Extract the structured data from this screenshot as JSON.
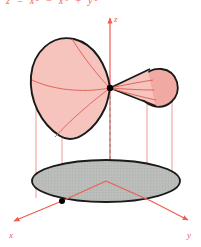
{
  "figure": {
    "kind": "3d-surface-plot",
    "caption_top": "z = x² − x³ + y²",
    "width": 201,
    "height": 247
  },
  "colors": {
    "axis_red": "#ef5d52",
    "surface_fill": "#f6c3bd",
    "surface_fill_lobe": "#f0aaa3",
    "surface_outline": "#1a1a1a",
    "contour_red": "#e0675c",
    "shadow_fill": "#b9bcb9",
    "shadow_outline": "#1a1a1a",
    "marker_black": "#000000",
    "projection_line": "#f09a92",
    "background": "#ffffff"
  },
  "axes": {
    "z": {
      "label": "z",
      "label_x": 115,
      "label_y": 22,
      "arrow_tip_x": 110,
      "arrow_tip_y": 14,
      "base_x": 110,
      "base_y": 182
    },
    "x": {
      "label": "x",
      "label_x": 11,
      "label_y": 240,
      "arrow_tip_x": 10,
      "arrow_tip_y": 222,
      "base_x": 62,
      "base_y": 201
    },
    "y": {
      "label": "y",
      "label_x": 189,
      "label_y": 240,
      "arrow_tip_x": 192,
      "arrow_tip_y": 222,
      "base_x": 120,
      "base_y": 196
    }
  },
  "surface": {
    "name": "upper-pink-surface",
    "outline_path": "M 110,88 C 104,62 88,40 66,39 C 44,38 30,56 30,78 C 30,104 48,131 74,137 C 93,141 105,118 110,88 Z",
    "lobe_path": "M 141,80 C 152,68 171,70 174,84 C 177,98 164,108 152,105 C 142,102 136,92 141,80 Z",
    "wedge_path": "M 110,88 L 146,72 L 152,105 Z",
    "contours": [
      "M 110,88 C 96,78 80,60 68,40",
      "M 110,88 C 92,96 66,118 50,140",
      "M 110,88 C 90,92 60,94 32,82",
      "M 110,88 C 124,86 138,84 150,82",
      "M 110,88 C 126,92 140,95 152,97",
      "M 110,88 C 122,89 136,90 148,90"
    ]
  },
  "shadow_region": {
    "name": "base-projection-ellipse",
    "center_x": 106,
    "center_y": 181,
    "radius_x": 74,
    "radius_y": 21
  },
  "markers": [
    {
      "name": "saddle-point-marker",
      "x": 110,
      "y": 88,
      "r": 3.2
    },
    {
      "name": "origin-marker",
      "x": 62,
      "y": 201,
      "r": 3.0
    }
  ],
  "projection_lines": [
    {
      "name": "projection-line-left-outer",
      "x": 36,
      "y_top": 82,
      "y_bottom": 196
    },
    {
      "name": "projection-line-left-inner",
      "x": 62,
      "y_top": 128,
      "y_bottom": 201
    },
    {
      "name": "projection-line-right-inner",
      "x": 147,
      "y_top": 100,
      "y_bottom": 194
    },
    {
      "name": "projection-line-right-outer",
      "x": 172,
      "y_top": 92,
      "y_bottom": 184
    }
  ],
  "dashed_segment": {
    "name": "z-axis-hidden-segment",
    "x": 110,
    "y_top": 88,
    "y_bottom": 160
  },
  "base_axis_lines": [
    {
      "name": "base-line-x",
      "x1": 106,
      "y1": 181,
      "x2": 62,
      "y2": 201
    },
    {
      "name": "base-line-y",
      "x1": 106,
      "y1": 181,
      "x2": 150,
      "y2": 201
    }
  ]
}
